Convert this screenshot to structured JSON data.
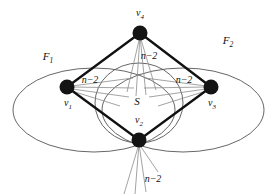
{
  "figure": {
    "type": "graph-diagram",
    "width": 277,
    "height": 194,
    "background_color": "#ffffff",
    "edge_color": "#111111",
    "fan_color": "#8c8c8c",
    "outline_color": "#555555",
    "vertex_fill": "#141414"
  },
  "vertices": [
    {
      "id": "v4",
      "label": "v",
      "sub": "4",
      "cx": 140,
      "cy": 33,
      "r": 7.5,
      "label_x": 140,
      "label_y": 14
    },
    {
      "id": "v1",
      "label": "v",
      "sub": "1",
      "cx": 67,
      "cy": 87,
      "r": 7.5,
      "label_x": 68,
      "label_y": 104
    },
    {
      "id": "v3",
      "label": "v",
      "sub": "3",
      "cx": 211,
      "cy": 87,
      "r": 7.5,
      "label_x": 212,
      "label_y": 104
    },
    {
      "id": "v2",
      "label": "v",
      "sub": "2",
      "cx": 139,
      "cy": 140,
      "r": 7.5,
      "label_x": 139,
      "label_y": 121
    }
  ],
  "edges": [
    {
      "from": "v4",
      "to": "v1"
    },
    {
      "from": "v4",
      "to": "v3"
    },
    {
      "from": "v1",
      "to": "v2"
    },
    {
      "from": "v3",
      "to": "v2"
    }
  ],
  "regions": [
    {
      "id": "F1",
      "label": "F",
      "sub": "1",
      "label_x": 48,
      "label_y": 58,
      "cx": 94,
      "cy": 110,
      "rx": 81,
      "ry": 42
    },
    {
      "id": "F2",
      "label": "F",
      "sub": "2",
      "label_x": 228,
      "label_y": 42,
      "cx": 183,
      "cy": 110,
      "rx": 81,
      "ry": 42
    },
    {
      "id": "S",
      "label": "S",
      "sub": "",
      "label_x": 137,
      "label_y": 101,
      "cx": 139,
      "cy": 103,
      "rx": 44,
      "ry": 40
    }
  ],
  "annotations": [
    {
      "id": "fan-count-v4",
      "text": "n−2",
      "x": 149,
      "y": 56
    },
    {
      "id": "fan-count-v1",
      "text": "n−2",
      "x": 90,
      "y": 80
    },
    {
      "id": "fan-count-v3",
      "text": "n−2",
      "x": 184,
      "y": 80
    },
    {
      "id": "fan-count-v2",
      "text": "n−2",
      "x": 153,
      "y": 179
    }
  ],
  "fans": [
    {
      "id": "fan-v4",
      "origin": "v4",
      "spread_label": "n−2"
    },
    {
      "id": "fan-v1",
      "origin": "v1",
      "spread_label": "n−2"
    },
    {
      "id": "fan-v3",
      "origin": "v3",
      "spread_label": "n−2"
    },
    {
      "id": "fan-v2-inner",
      "origin": "v2",
      "spread_label": "n−2"
    },
    {
      "id": "fan-v2-outer",
      "origin": "v2",
      "spread_label": "n−2"
    }
  ]
}
